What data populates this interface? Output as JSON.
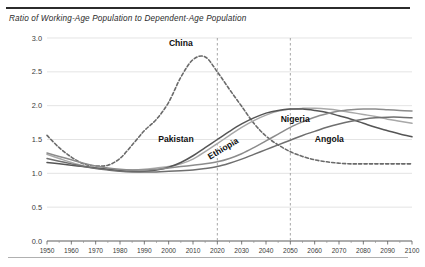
{
  "chart_data": {
    "type": "line",
    "title": "Ratio of Working-Age Population to Dependent-Age Population",
    "xlabel": "",
    "ylabel": "",
    "xlim": [
      1950,
      2100
    ],
    "ylim": [
      0.0,
      3.0
    ],
    "ytick_labels": [
      "0.0",
      "0.5",
      "1.0",
      "1.5",
      "2.0",
      "2.5",
      "3.0"
    ],
    "ytick_values": [
      0.0,
      0.5,
      1.0,
      1.5,
      2.0,
      2.5,
      3.0
    ],
    "xtick_labels": [
      "1950",
      "1960",
      "1970",
      "1980",
      "1990",
      "2000",
      "2010",
      "2020",
      "2030",
      "2040",
      "2050",
      "2060",
      "2070",
      "2080",
      "2090",
      "2100"
    ],
    "xtick_values": [
      1950,
      1960,
      1970,
      1980,
      1990,
      2000,
      2010,
      2020,
      2030,
      2040,
      2050,
      2060,
      2070,
      2080,
      2090,
      2100
    ],
    "grid": true,
    "legend_position": "inline-annotations",
    "annotations": [
      {
        "text": "China",
        "x": 2005,
        "y": 2.88,
        "rotation": 0
      },
      {
        "text": "Pakistan",
        "x": 2003,
        "y": 1.47,
        "rotation": 0
      },
      {
        "text": "Ethiopia",
        "x": 2023,
        "y": 1.33,
        "rotation": -31
      },
      {
        "text": "Nigeria",
        "x": 2052,
        "y": 1.76,
        "rotation": 0
      },
      {
        "text": "Angola",
        "x": 2066,
        "y": 1.46,
        "rotation": 0
      }
    ],
    "reference_lines": [
      {
        "x": 2020,
        "style": "dashed"
      },
      {
        "x": 2050,
        "style": "dashed"
      }
    ],
    "x": [
      1950,
      1955,
      1960,
      1965,
      1970,
      1975,
      1980,
      1985,
      1990,
      1995,
      2000,
      2005,
      2010,
      2015,
      2020,
      2025,
      2030,
      2035,
      2040,
      2045,
      2050,
      2055,
      2060,
      2065,
      2070,
      2075,
      2080,
      2085,
      2090,
      2095,
      2100
    ],
    "series": [
      {
        "name": "China",
        "style": "dashed",
        "color": "#6a6a6a",
        "values": [
          1.56,
          1.38,
          1.24,
          1.14,
          1.11,
          1.12,
          1.22,
          1.42,
          1.63,
          1.8,
          2.05,
          2.42,
          2.68,
          2.72,
          2.5,
          2.24,
          1.99,
          1.74,
          1.55,
          1.42,
          1.32,
          1.25,
          1.2,
          1.17,
          1.15,
          1.14,
          1.14,
          1.14,
          1.14,
          1.14,
          1.14
        ]
      },
      {
        "name": "Pakistan",
        "style": "solid",
        "color": "#a8a8a8",
        "values": [
          1.28,
          1.22,
          1.16,
          1.11,
          1.08,
          1.06,
          1.05,
          1.05,
          1.06,
          1.08,
          1.1,
          1.14,
          1.21,
          1.32,
          1.44,
          1.56,
          1.68,
          1.78,
          1.86,
          1.92,
          1.95,
          1.96,
          1.96,
          1.95,
          1.93,
          1.9,
          1.87,
          1.84,
          1.8,
          1.77,
          1.74
        ]
      },
      {
        "name": "Ethiopia",
        "style": "solid",
        "color": "#555555",
        "values": [
          1.16,
          1.14,
          1.12,
          1.1,
          1.08,
          1.06,
          1.04,
          1.03,
          1.03,
          1.05,
          1.09,
          1.16,
          1.26,
          1.38,
          1.5,
          1.62,
          1.73,
          1.82,
          1.89,
          1.93,
          1.95,
          1.95,
          1.93,
          1.9,
          1.85,
          1.8,
          1.74,
          1.68,
          1.63,
          1.58,
          1.54
        ]
      },
      {
        "name": "Nigeria",
        "style": "solid",
        "color": "#8c8c8c",
        "values": [
          1.3,
          1.25,
          1.2,
          1.15,
          1.11,
          1.08,
          1.06,
          1.05,
          1.05,
          1.06,
          1.08,
          1.1,
          1.12,
          1.14,
          1.17,
          1.22,
          1.29,
          1.38,
          1.48,
          1.58,
          1.68,
          1.76,
          1.83,
          1.88,
          1.92,
          1.94,
          1.95,
          1.95,
          1.94,
          1.93,
          1.92
        ]
      },
      {
        "name": "Angola",
        "style": "solid",
        "color": "#6f6f6f",
        "values": [
          1.22,
          1.18,
          1.14,
          1.1,
          1.07,
          1.05,
          1.03,
          1.02,
          1.02,
          1.02,
          1.03,
          1.04,
          1.05,
          1.07,
          1.1,
          1.15,
          1.21,
          1.28,
          1.35,
          1.42,
          1.49,
          1.56,
          1.62,
          1.68,
          1.73,
          1.77,
          1.8,
          1.82,
          1.83,
          1.83,
          1.82
        ]
      }
    ]
  }
}
